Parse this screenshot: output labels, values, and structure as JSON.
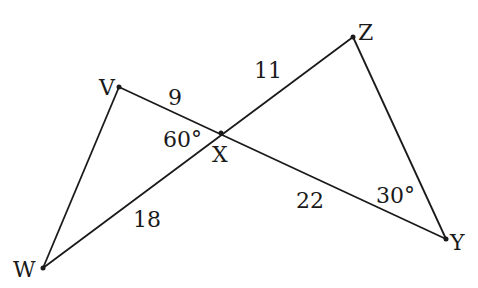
{
  "diagram": {
    "points": {
      "V": {
        "label": "V",
        "x": 119,
        "y": 87
      },
      "X": {
        "label": "X",
        "x": 221,
        "y": 133
      },
      "Z": {
        "label": "Z",
        "x": 353,
        "y": 37
      },
      "Y": {
        "label": "Y",
        "x": 446,
        "y": 239
      },
      "W": {
        "label": "W",
        "x": 43,
        "y": 268
      }
    },
    "segments": [
      {
        "from": "V",
        "to": "Y"
      },
      {
        "from": "W",
        "to": "Z"
      },
      {
        "from": "V",
        "to": "W"
      },
      {
        "from": "Z",
        "to": "Y"
      }
    ],
    "lengths": {
      "VX": "9",
      "XZ": "11",
      "WX": "18",
      "XY": "22"
    },
    "angles": {
      "VXW": "60°",
      "XYZ": "30°"
    }
  }
}
